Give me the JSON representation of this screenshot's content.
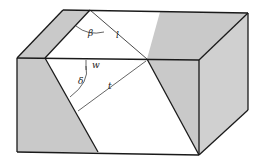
{
  "figure": {
    "colors": {
      "background": "#ffffff",
      "shade": "#c9c9c9",
      "line": "#1a1a1a"
    },
    "labels": {
      "beta": "β",
      "l_top": "l",
      "w": "w",
      "delta": "δ",
      "t": "t"
    }
  }
}
